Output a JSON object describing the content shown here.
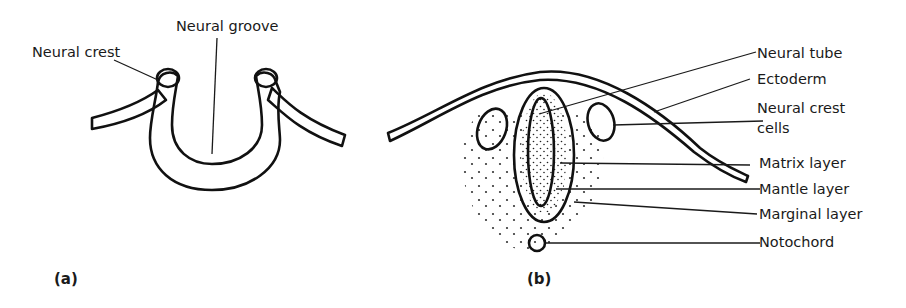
{
  "figure": {
    "panel_a": {
      "caption": "(a)",
      "labels": {
        "neural_crest": "Neural crest",
        "neural_groove": "Neural groove"
      }
    },
    "panel_b": {
      "caption": "(b)",
      "labels": {
        "neural_tube": "Neural tube",
        "ectoderm": "Ectoderm",
        "neural_crest_cells_line1": "Neural crest",
        "neural_crest_cells_line2": "cells",
        "matrix_layer": "Matrix layer",
        "mantle_layer": "Mantle layer",
        "marginal_layer": "Marginal layer",
        "notochord": "Notochord"
      }
    },
    "colors": {
      "ink": "#111111",
      "background": "#ffffff"
    }
  }
}
